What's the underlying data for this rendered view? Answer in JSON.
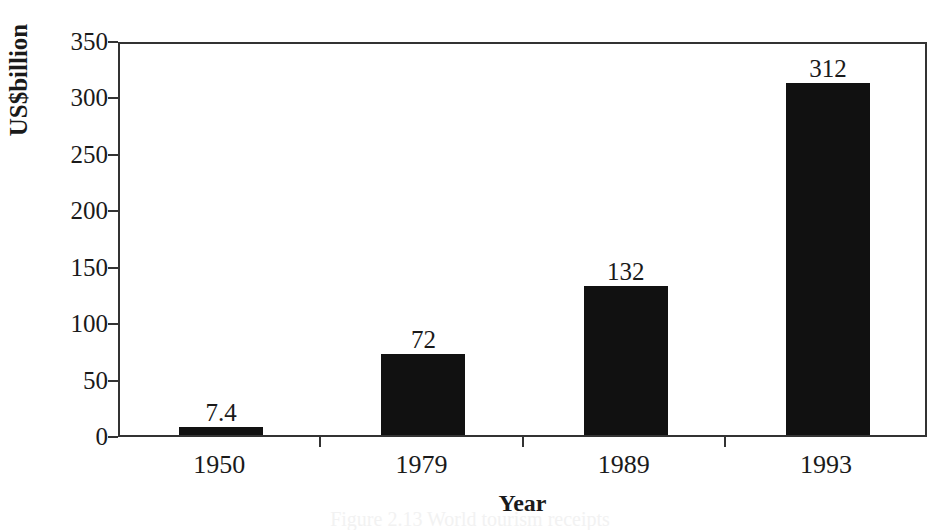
{
  "chart_data": {
    "type": "bar",
    "title": "",
    "xlabel": "Year",
    "ylabel": "US$billion",
    "categories": [
      "1950",
      "1979",
      "1989",
      "1993"
    ],
    "values": [
      7.4,
      72,
      132,
      312
    ],
    "value_labels": [
      "7.4",
      "72",
      "132",
      "312"
    ],
    "ylim": [
      0,
      350
    ],
    "yticks": [
      0,
      50,
      100,
      150,
      200,
      250,
      300,
      350
    ],
    "ytick_labels": [
      "0",
      "50",
      "100",
      "150",
      "200",
      "250",
      "300",
      "350"
    ],
    "grid": false,
    "legend": false,
    "bar_color": "#111111",
    "axis_color": "#333333",
    "background_color": "#ffffff"
  },
  "caption": {
    "text": "Figure 2.13  World tourism receipts"
  }
}
